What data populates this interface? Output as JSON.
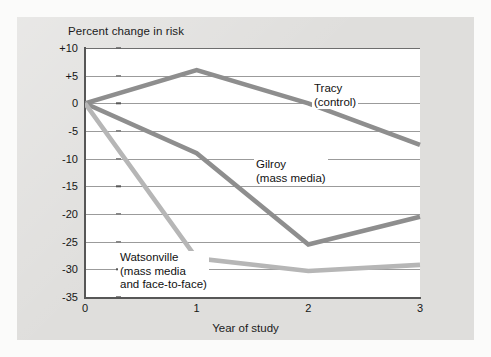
{
  "figure": {
    "title": "Percent change in risk",
    "x_axis_title": "Year of study",
    "background_color": "#e3e2e0",
    "plot_background_color": "#ffffff"
  },
  "chart_data": {
    "type": "line",
    "title": "Percent change in risk",
    "xlabel": "Year of study",
    "ylabel": "Percent change in risk",
    "x": [
      0,
      1,
      2,
      3
    ],
    "xtick_labels": [
      "0",
      "1",
      "2",
      "3"
    ],
    "xlim": [
      0,
      3
    ],
    "ylim": [
      -35,
      10
    ],
    "ytick_labels": [
      "+10",
      "+5",
      "0",
      "-5",
      "-10",
      "-15",
      "-20",
      "-25",
      "-30",
      "-35"
    ],
    "ytick_values": [
      10,
      5,
      0,
      -5,
      -10,
      -15,
      -20,
      -25,
      -30,
      -35
    ],
    "grid": true,
    "grid_axis": "y",
    "legend": "inline-annotations",
    "series": [
      {
        "name": "Tracy (control)",
        "label_lines": [
          "Tracy",
          "(control)"
        ],
        "color": "#8e8e8e",
        "values": [
          0,
          6,
          0,
          -7.5
        ]
      },
      {
        "name": "Gilroy (mass media)",
        "label_lines": [
          "Gilroy",
          "(mass media)"
        ],
        "color": "#8e8e8e",
        "values": [
          0,
          -9,
          -25.5,
          -20.5
        ]
      },
      {
        "name": "Watsonville (mass media and face-to-face)",
        "label_lines": [
          "Watsonville",
          "(mass media",
          "and face-to-face)"
        ],
        "color": "#b6b6b6",
        "values": [
          0,
          -28,
          -30.3,
          -29.2
        ]
      }
    ]
  },
  "labels": {
    "tracy_line1": "Tracy",
    "tracy_line2": "(control)",
    "gilroy_line1": "Gilroy",
    "gilroy_line2": "(mass media)",
    "watsonville_line1": "Watsonville",
    "watsonville_line2": "(mass media",
    "watsonville_line3": "and face-to-face)"
  },
  "ticks": {
    "y": [
      "+10",
      "+5",
      "0",
      "-5",
      "-10",
      "-15",
      "-20",
      "-25",
      "-30",
      "-35"
    ],
    "x": [
      "0",
      "1",
      "2",
      "3"
    ]
  }
}
